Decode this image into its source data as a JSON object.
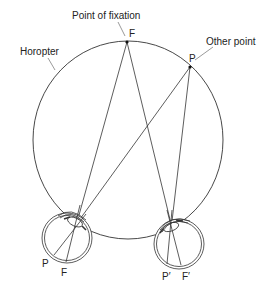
{
  "diagram": {
    "type": "horopter-binocular-vision",
    "labels": {
      "horopter": "Horopter",
      "point_of_fixation": "Point of fixation",
      "other_point": "Other point",
      "fixation_point": "F",
      "other_point_marker": "P",
      "left_retina_p": "P",
      "left_retina_f": "F",
      "right_retina_p": "P′",
      "right_retina_f": "F′"
    },
    "colors": {
      "line": "#333333",
      "background": "#ffffff"
    }
  }
}
